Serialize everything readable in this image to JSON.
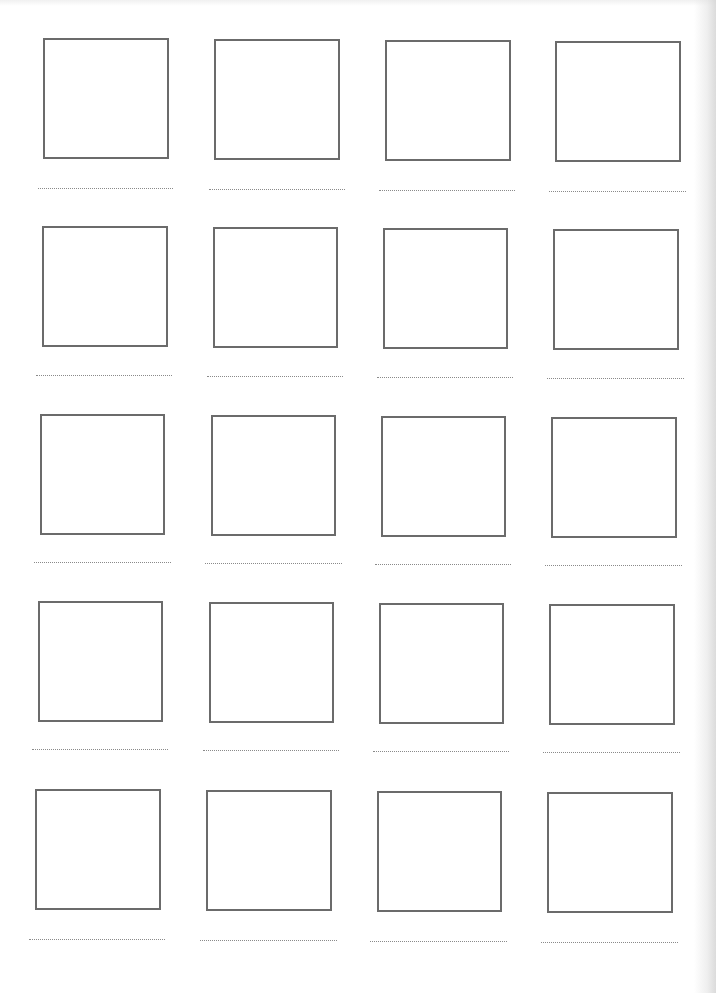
{
  "document": {
    "type": "worksheet",
    "description": "Blank grid of 20 empty frames, each with a dotted writing line beneath",
    "rows": 5,
    "columns": 4,
    "colors": {
      "frame_border": "#6b6b6b",
      "dotted_line": "#8a8a8a",
      "paper": "#ffffff"
    },
    "cells": [
      {
        "row": 1,
        "col": 1,
        "box": [
          43,
          38,
          126,
          121
        ],
        "line": [
          38,
          188,
          135
        ]
      },
      {
        "row": 1,
        "col": 2,
        "box": [
          214,
          39,
          126,
          121
        ],
        "line": [
          209,
          189,
          136
        ]
      },
      {
        "row": 1,
        "col": 3,
        "box": [
          385,
          40,
          126,
          121
        ],
        "line": [
          379,
          190,
          136
        ]
      },
      {
        "row": 1,
        "col": 4,
        "box": [
          555,
          41,
          126,
          121
        ],
        "line": [
          549,
          191,
          137
        ]
      },
      {
        "row": 2,
        "col": 1,
        "box": [
          42,
          226,
          126,
          121
        ],
        "line": [
          36,
          375,
          136
        ]
      },
      {
        "row": 2,
        "col": 2,
        "box": [
          213,
          227,
          125,
          121
        ],
        "line": [
          207,
          376,
          136
        ]
      },
      {
        "row": 2,
        "col": 3,
        "box": [
          383,
          228,
          125,
          121
        ],
        "line": [
          377,
          377,
          136
        ]
      },
      {
        "row": 2,
        "col": 4,
        "box": [
          553,
          229,
          126,
          121
        ],
        "line": [
          547,
          378,
          137
        ]
      },
      {
        "row": 3,
        "col": 1,
        "box": [
          40,
          414,
          125,
          121
        ],
        "line": [
          34,
          562,
          137
        ]
      },
      {
        "row": 3,
        "col": 2,
        "box": [
          211,
          415,
          125,
          121
        ],
        "line": [
          205,
          563,
          137
        ]
      },
      {
        "row": 3,
        "col": 3,
        "box": [
          381,
          416,
          125,
          121
        ],
        "line": [
          375,
          564,
          136
        ]
      },
      {
        "row": 3,
        "col": 4,
        "box": [
          551,
          417,
          126,
          121
        ],
        "line": [
          545,
          565,
          137
        ]
      },
      {
        "row": 4,
        "col": 1,
        "box": [
          38,
          601,
          125,
          121
        ],
        "line": [
          32,
          749,
          136
        ]
      },
      {
        "row": 4,
        "col": 2,
        "box": [
          209,
          602,
          125,
          121
        ],
        "line": [
          203,
          750,
          136
        ]
      },
      {
        "row": 4,
        "col": 3,
        "box": [
          379,
          603,
          125,
          121
        ],
        "line": [
          373,
          751,
          136
        ]
      },
      {
        "row": 4,
        "col": 4,
        "box": [
          549,
          604,
          126,
          121
        ],
        "line": [
          543,
          752,
          137
        ]
      },
      {
        "row": 5,
        "col": 1,
        "box": [
          35,
          789,
          126,
          121
        ],
        "line": [
          29,
          939,
          136
        ]
      },
      {
        "row": 5,
        "col": 2,
        "box": [
          206,
          790,
          126,
          121
        ],
        "line": [
          200,
          940,
          137
        ]
      },
      {
        "row": 5,
        "col": 3,
        "box": [
          377,
          791,
          125,
          121
        ],
        "line": [
          370,
          941,
          137
        ]
      },
      {
        "row": 5,
        "col": 4,
        "box": [
          547,
          792,
          126,
          121
        ],
        "line": [
          541,
          942,
          137
        ]
      }
    ]
  }
}
